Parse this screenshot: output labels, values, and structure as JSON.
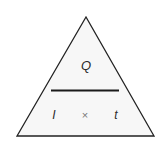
{
  "diagram": {
    "type": "formula-triangle",
    "top": "Q",
    "bottom_left": "I",
    "operator": "×",
    "bottom_right": "t",
    "colors": {
      "stroke": "#222222",
      "fill": "#f7f7f7",
      "text": "#2a2a2a",
      "operator": "#777777"
    }
  }
}
